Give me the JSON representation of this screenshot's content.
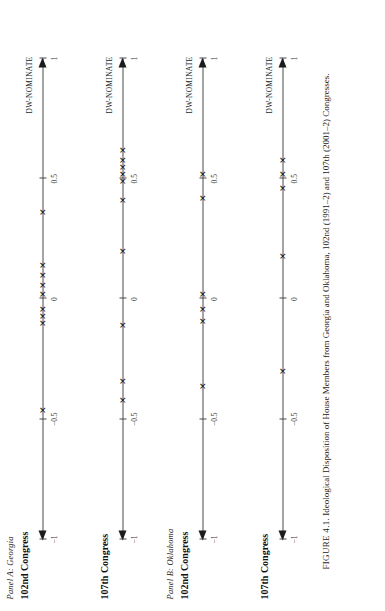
{
  "figure": {
    "caption_prefix": "FIGURE 4.1.",
    "caption_text": " Ideological Disposition of House Members from Georgia and Oklahoma, 102nd (1991–2) and 107th (2001–2) Congresses.",
    "axis_name": "DW-NOMINATE",
    "marker_glyph": "✕"
  },
  "chart_data": {
    "type": "scatter",
    "title": "FIGURE 4.1. Ideological Disposition of House Members from Georgia and Oklahoma, 102nd (1991–2) and 107th (2001–2) Congresses.",
    "xlabel": "DW-NOMINATE",
    "ylabel": "",
    "xlim": [
      -1,
      1
    ],
    "xticks": [
      -1,
      -0.5,
      0,
      0.5,
      1
    ],
    "xticklabels": [
      "−1",
      "−0.5",
      "0",
      "0.5",
      "1"
    ],
    "grid": false,
    "legend": "none",
    "panels": [
      {
        "panel_label": "Panel A: Georgia",
        "axes": [
          {
            "title": "102nd Congress",
            "axis_name": "DW-NOMINATE",
            "values": [
              -0.46,
              -0.1,
              -0.07,
              -0.04,
              0.02,
              0.06,
              0.1,
              0.14,
              0.36
            ]
          },
          {
            "title": "107th Congress",
            "axis_name": "DW-NOMINATE",
            "values": [
              -0.42,
              -0.34,
              -0.11,
              0.2,
              0.41,
              0.49,
              0.52,
              0.55,
              0.58,
              0.62
            ]
          }
        ]
      },
      {
        "panel_label": "Panel B: Oklahoma",
        "axes": [
          {
            "title": "102nd Congress",
            "axis_name": "DW-NOMINATE",
            "values": [
              -0.36,
              -0.09,
              -0.04,
              0.02,
              0.42,
              0.52
            ]
          },
          {
            "title": "107th Congress",
            "axis_name": "DW-NOMINATE",
            "values": [
              -0.3,
              0.18,
              0.46,
              0.52,
              0.58
            ]
          }
        ]
      }
    ]
  }
}
